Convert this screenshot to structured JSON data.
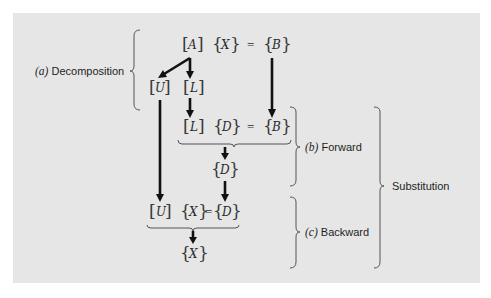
{
  "figure": {
    "panel_color": "#e6e6e6",
    "arrow_color": "#111111",
    "steps": {
      "decomposition": {
        "label_prefix": "(a)",
        "label_text": " Decomposition"
      },
      "forward": {
        "label_prefix": "(b)",
        "label_text": " Forward"
      },
      "backward": {
        "label_prefix": "(c)",
        "label_text": " Backward"
      },
      "substitution": {
        "label_text": "Substitution"
      }
    },
    "equations": {
      "original": {
        "matrix": "A",
        "unknown": "X",
        "equals": "=",
        "rhs": "B"
      },
      "factors": {
        "upper": "U",
        "lower": "L"
      },
      "forward_eq": {
        "matrix": "L",
        "unknown": "D",
        "equals": "=",
        "rhs": "B"
      },
      "forward_result": {
        "vector": "D"
      },
      "backward_eq": {
        "matrix": "U",
        "unknown": "X",
        "equals": "=",
        "rhs": "D"
      },
      "backward_result": {
        "vector": "X"
      }
    }
  }
}
